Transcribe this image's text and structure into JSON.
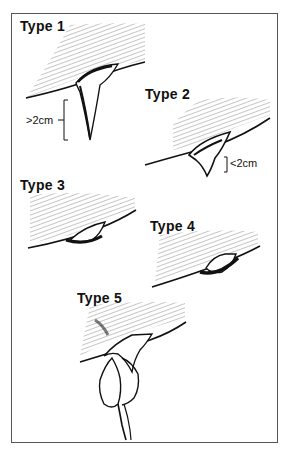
{
  "figure": {
    "panels": [
      {
        "id": "type1",
        "label": "Type 1",
        "measurement": ">2cm"
      },
      {
        "id": "type2",
        "label": "Type 2",
        "measurement": "<2cm"
      },
      {
        "id": "type3",
        "label": "Type 3"
      },
      {
        "id": "type4",
        "label": "Type 4"
      },
      {
        "id": "type5",
        "label": "Type 5"
      }
    ]
  }
}
